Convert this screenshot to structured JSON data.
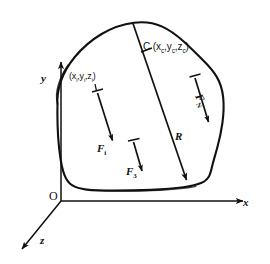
{
  "figure": {
    "background_color": "#ffffff",
    "ink_color": "#111111"
  },
  "axes": {
    "origin_label": "O",
    "x_label": "x",
    "y_label": "y",
    "z_label": "z"
  },
  "body": {
    "name": "irregular-rigid-body-outline"
  },
  "points": {
    "centroid": {
      "name": "C",
      "coords_open": "(",
      "x": "x",
      "x_sub": "c",
      "comma1": ",",
      "y": "y",
      "y_sub": "c",
      "comma2": ",",
      "z": "z",
      "z_sub": "c",
      "coords_close": ")",
      "full_text": "C (x c , y c , z c )"
    },
    "element": {
      "coords_open": "(",
      "x": "x",
      "x_sub": "i",
      "comma1": ",",
      "y": "y",
      "y_sub": "i",
      "comma2": ",",
      "z": "z",
      "z_sub": "i",
      "coords_close": ")",
      "full_text": "(x i , y i , z i )"
    }
  },
  "vectors": [
    {
      "id": "F-i",
      "symbol": "F",
      "subscript": "i",
      "description": "force on i-th element, downward"
    },
    {
      "id": "F-3",
      "symbol": "F",
      "subscript": "3",
      "description": "third force, downward"
    },
    {
      "id": "F-N",
      "symbol": "F",
      "subscript": "N",
      "description": "N-th force, downward"
    },
    {
      "id": "R",
      "symbol": "R",
      "subscript": "",
      "description": "resultant force through centroid C"
    }
  ]
}
